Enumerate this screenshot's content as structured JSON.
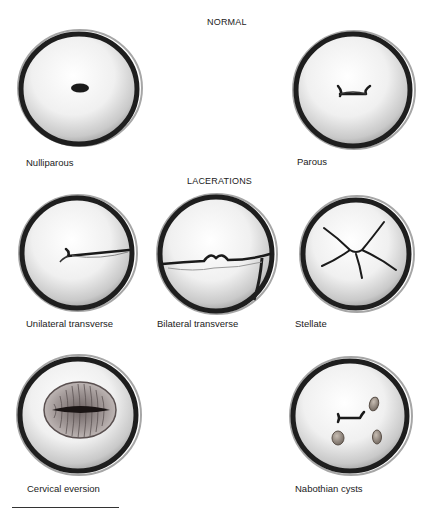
{
  "sections": {
    "normal": {
      "title": "NORMAL"
    },
    "lacerations": {
      "title": "LACERATIONS"
    }
  },
  "figures": [
    {
      "id": "nulliparous",
      "label": "Nulliparous",
      "section": "normal"
    },
    {
      "id": "parous",
      "label": "Parous",
      "section": "normal"
    },
    {
      "id": "unilateral-transverse",
      "label": "Unilateral transverse",
      "section": "lacerations"
    },
    {
      "id": "bilateral-transverse",
      "label": "Bilateral transverse",
      "section": "lacerations"
    },
    {
      "id": "stellate",
      "label": "Stellate",
      "section": "lacerations"
    },
    {
      "id": "cervical-eversion",
      "label": "Cervical eversion",
      "section": "other"
    },
    {
      "id": "nabothian-cysts",
      "label": "Nabothian cysts",
      "section": "other"
    }
  ],
  "colors": {
    "rim": "#1e1e1e",
    "surface": "#f4f4f4",
    "shadow": "#bdbdbd",
    "tissue": "#9a8f8f",
    "cyst": "#8c8078"
  }
}
